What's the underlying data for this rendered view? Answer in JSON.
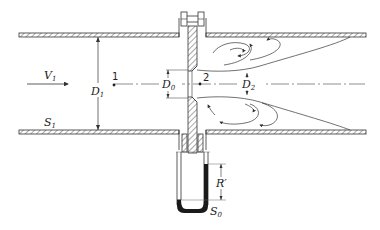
{
  "diagram": {
    "labels": {
      "velocity": "V",
      "velocity_sub": "1",
      "pipe_diameter": "D",
      "pipe_diameter_sub": "1",
      "orifice_diameter": "D",
      "orifice_diameter_sub": "0",
      "vena_contracta_diameter": "D",
      "vena_contracta_diameter_sub": "2",
      "section_1": "1",
      "section_2": "2",
      "surface_1": "S",
      "surface_1_sub": "1",
      "manometer_reading": "R′",
      "manometer_fluid": "S",
      "manometer_fluid_sub": "0"
    },
    "colors": {
      "line": "#333333",
      "hatch": "#555555",
      "manometer_fluid": "#1a1a1a",
      "background": "#ffffff"
    }
  }
}
